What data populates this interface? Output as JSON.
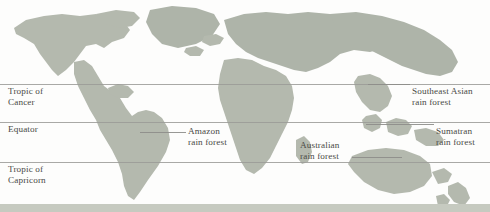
{
  "figure": {
    "name": "world-rainforest-map",
    "width": 490,
    "height": 212,
    "background_color": "#fdfdfc",
    "land_color": "#b4b9ae",
    "line_color": "#9a9a96",
    "text_color": "#4a4a46"
  },
  "latitude_lines": [
    {
      "id": "tropic-of-cancer",
      "label": "Tropic of\nCancer",
      "y": 84,
      "label_x": 8,
      "label_y": 86
    },
    {
      "id": "equator",
      "label": "Equator",
      "y": 122,
      "label_x": 8,
      "label_y": 124
    },
    {
      "id": "tropic-of-capricorn",
      "label": "Tropic of\nCapricorn",
      "y": 162,
      "label_x": 8,
      "label_y": 164
    }
  ],
  "rainforest_labels": [
    {
      "id": "southeast-asian-rain-forest",
      "label": "Southeast Asian\nrain forest",
      "label_x": 412,
      "label_y": 84,
      "leader": {
        "x": 368,
        "y": 84,
        "width": 42
      }
    },
    {
      "id": "sumatran-rain-forest",
      "label": "Sumatran\nrain forest",
      "label_x": 436,
      "label_y": 124,
      "leader": {
        "x": 366,
        "y": 124,
        "width": 68
      }
    },
    {
      "id": "amazon-rain-forest",
      "label": "Amazon\nrain forest",
      "label_x": 188,
      "label_y": 128,
      "leader": {
        "x": 140,
        "y": 132,
        "width": 46
      }
    },
    {
      "id": "australian-rain-forest",
      "label": "Australian\nrain forest",
      "label_x": 300,
      "label_y": 140,
      "leader": {
        "x": 352,
        "y": 157,
        "width": 50
      }
    }
  ]
}
